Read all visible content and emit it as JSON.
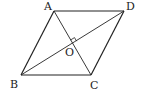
{
  "diagram": {
    "type": "rhombus",
    "labels": {
      "A": "A",
      "B": "B",
      "C": "C",
      "D": "D",
      "O": "O"
    },
    "points": {
      "A": [
        54,
        11
      ],
      "D": [
        124,
        11
      ],
      "B": [
        21,
        75
      ],
      "C": [
        91,
        75
      ],
      "O": [
        72,
        43
      ]
    },
    "edges": [
      [
        "A",
        "D"
      ],
      [
        "D",
        "C"
      ],
      [
        "C",
        "B"
      ],
      [
        "B",
        "A"
      ],
      [
        "A",
        "C"
      ],
      [
        "B",
        "D"
      ]
    ],
    "right_angle_at": "O",
    "stroke_color": "#222222"
  }
}
